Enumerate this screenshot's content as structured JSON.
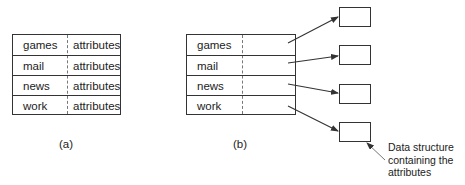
{
  "figure_a": {
    "label": "(a)",
    "rows": [
      {
        "name": "games",
        "value": "attributes"
      },
      {
        "name": "mail",
        "value": "attributes"
      },
      {
        "name": "news",
        "value": "attributes"
      },
      {
        "name": "work",
        "value": "attributes"
      }
    ]
  },
  "figure_b": {
    "label": "(b)",
    "rows": [
      {
        "name": "games"
      },
      {
        "name": "mail"
      },
      {
        "name": "news"
      },
      {
        "name": "work"
      }
    ],
    "annotation": {
      "line1": "Data structure",
      "line2": "containing the",
      "line3": "attributes"
    }
  },
  "colors": {
    "line": "#333333",
    "divider": "#777777",
    "text": "#222222"
  }
}
